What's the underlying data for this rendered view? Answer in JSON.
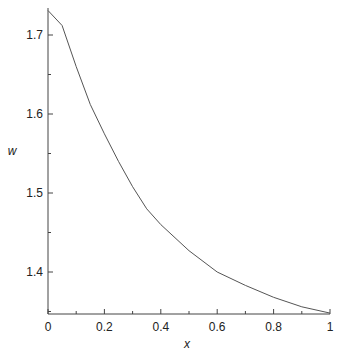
{
  "chart_data": {
    "type": "line",
    "title": "",
    "xlabel": "x",
    "ylabel": "w",
    "xlim": [
      0,
      1
    ],
    "ylim": [
      1.348,
      1.73
    ],
    "grid": false,
    "x_ticks": [
      "0",
      "0.2",
      "0.4",
      "0.6",
      "0.8",
      "1"
    ],
    "y_ticks": [
      "1.4",
      "1.5",
      "1.6",
      "1.7"
    ],
    "series": [
      {
        "name": "w(x)",
        "x": [
          0,
          0.05,
          0.1,
          0.15,
          0.2,
          0.25,
          0.3,
          0.35,
          0.4,
          0.5,
          0.6,
          0.7,
          0.8,
          0.9,
          1.0
        ],
        "values": [
          1.731,
          1.712,
          1.66,
          1.612,
          1.575,
          1.54,
          1.508,
          1.48,
          1.46,
          1.427,
          1.4,
          1.383,
          1.368,
          1.356,
          1.348
        ]
      }
    ],
    "color": "#555555"
  }
}
